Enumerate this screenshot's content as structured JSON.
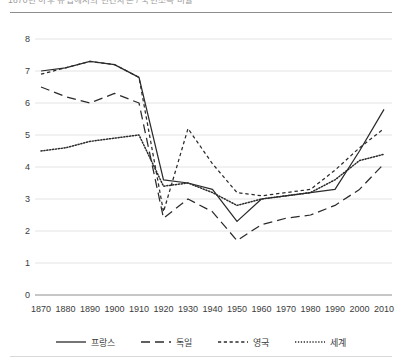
{
  "figure": {
    "clipped_title": "1870년 이후 유럽에서의 민간자본 / 국민소득 비율",
    "legend_position": "bottom"
  },
  "chart_data": {
    "type": "line",
    "title": "",
    "xlabel": "",
    "ylabel": "",
    "x": [
      1870,
      1880,
      1890,
      1900,
      1910,
      1920,
      1930,
      1940,
      1950,
      1960,
      1970,
      1980,
      1990,
      2000,
      2010
    ],
    "xticklabels": [
      "1870",
      "1880",
      "1890",
      "1900",
      "1910",
      "1920",
      "1930",
      "1940",
      "1950",
      "1960",
      "1970",
      "1980",
      "1990",
      "2000",
      "2010"
    ],
    "yticklabels": [
      "0",
      "1",
      "2",
      "3",
      "4",
      "5",
      "6",
      "7",
      "8"
    ],
    "ylim": [
      0,
      8
    ],
    "ytick_step": 1,
    "grid": true,
    "series": [
      {
        "name": "프랑스",
        "style": "solid",
        "color": "#2b2b2b",
        "values": [
          7.0,
          7.1,
          7.3,
          7.2,
          6.8,
          3.6,
          3.5,
          3.3,
          2.3,
          3.0,
          3.1,
          3.2,
          3.3,
          4.5,
          5.8
        ]
      },
      {
        "name": "독일",
        "style": "dashed",
        "color": "#2b2b2b",
        "values": [
          6.5,
          6.2,
          6.0,
          6.3,
          6.0,
          2.4,
          3.0,
          2.6,
          1.7,
          2.2,
          2.4,
          2.5,
          2.8,
          3.3,
          4.1
        ]
      },
      {
        "name": "영국",
        "style": "shortdash",
        "color": "#2b2b2b",
        "values": [
          6.9,
          7.1,
          7.3,
          7.2,
          6.8,
          2.6,
          5.2,
          4.1,
          3.2,
          3.1,
          3.2,
          3.3,
          3.9,
          4.6,
          5.2
        ]
      },
      {
        "name": "세계",
        "style": "dotted",
        "color": "#2b2b2b",
        "values": [
          4.5,
          4.6,
          4.8,
          4.9,
          5.0,
          3.4,
          3.5,
          3.2,
          2.8,
          3.0,
          3.1,
          3.2,
          3.6,
          4.2,
          4.4
        ]
      }
    ]
  },
  "legend": {
    "items": [
      {
        "label": "프랑스",
        "style": "solid"
      },
      {
        "label": "독일",
        "style": "dashed"
      },
      {
        "label": "영국",
        "style": "shortdash"
      },
      {
        "label": "세계",
        "style": "dotted"
      }
    ]
  }
}
